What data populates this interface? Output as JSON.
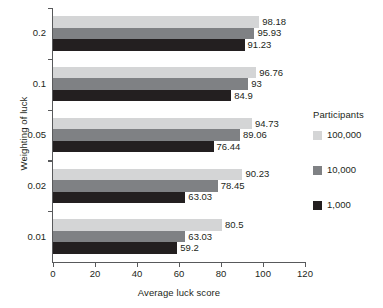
{
  "chart_data": {
    "type": "bar",
    "orientation": "horizontal",
    "title": "",
    "xlabel": "Average luck score",
    "ylabel": "Weighting of luck",
    "xlim": [
      0,
      120
    ],
    "xticks": [
      0,
      20,
      40,
      60,
      80,
      100,
      120
    ],
    "grid": false,
    "legend": {
      "title": "Participants",
      "position": "right",
      "entries": [
        {
          "name": "100,000",
          "color": "#d4d5d6"
        },
        {
          "name": "10,000",
          "color": "#7f8184"
        },
        {
          "name": "1,000",
          "color": "#231f20"
        }
      ]
    },
    "categories": [
      "0.2",
      "0.1",
      "0.05",
      "0.02",
      "0.01"
    ],
    "series": [
      {
        "name": "100,000",
        "color": "#d4d5d6",
        "values": [
          98.18,
          96.76,
          94.73,
          90.23,
          80.5
        ]
      },
      {
        "name": "10,000",
        "color": "#7f8184",
        "values": [
          95.93,
          93,
          89.06,
          78.45,
          63.03
        ]
      },
      {
        "name": "1,000",
        "color": "#231f20",
        "values": [
          91.23,
          84.9,
          76.44,
          63.03,
          59.2
        ]
      }
    ],
    "value_labels": [
      [
        "98.18",
        "95.93",
        "91.23"
      ],
      [
        "96.76",
        "93",
        "84.9"
      ],
      [
        "94.73",
        "89.06",
        "76.44"
      ],
      [
        "90.23",
        "78.45",
        "63.03"
      ],
      [
        "80.5",
        "63.03",
        "59.2"
      ]
    ]
  }
}
